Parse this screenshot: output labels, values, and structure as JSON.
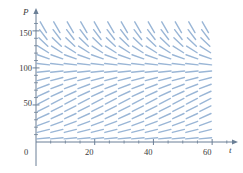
{
  "chart_data": {
    "type": "line",
    "subtype": "direction-field",
    "title": "",
    "subtitle": "",
    "xlabel": "t",
    "ylabel": "P",
    "xlim": [
      -4,
      66
    ],
    "ylim": [
      -8,
      163
    ],
    "x_ticks_major": [
      0,
      20,
      40,
      60
    ],
    "x_tick_labels": [
      "0",
      "20",
      "40",
      "60"
    ],
    "x_ticks_minor": [
      5,
      10,
      15,
      25,
      30,
      35,
      45,
      50,
      55,
      65
    ],
    "y_ticks_major": [
      50,
      100,
      150
    ],
    "y_tick_labels": [
      "50",
      "100",
      "150"
    ],
    "y_ticks_minor": [
      10,
      20,
      30,
      40,
      60,
      70,
      80,
      90,
      110,
      120,
      130,
      140,
      160
    ],
    "grid": false,
    "legend": null,
    "annotations": [],
    "equilibrium": 100,
    "equation": "dP/dt = k P (1 - P/100)",
    "growth_rate": 0.08,
    "carrying_capacity": 100,
    "field": {
      "x_start": 2.5,
      "x_step": 4.6,
      "x_count": 13,
      "y_start": 5,
      "y_step": 10,
      "y_count": 16,
      "segment_half_length_px": 6.2,
      "color": "#9ab6d6",
      "line_width": 1.4
    },
    "origin_label": "0"
  },
  "axes": {
    "x_axis_name": "t",
    "y_axis_name": "P",
    "x_axis_color": "#6b7f96",
    "y_axis_color": "#6b7f96",
    "arrow_x": "t-axis-arrow",
    "arrow_y": "P-axis-arrow"
  },
  "colors": {
    "slope_marks": "#9ab6d6",
    "axis": "#6b7f96",
    "text": "#3a3a3a",
    "background": "#ffffff"
  }
}
